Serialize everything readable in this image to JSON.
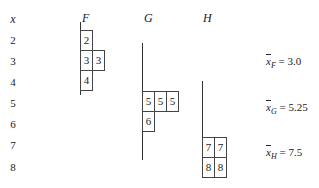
{
  "x_axis": {
    "header": "x",
    "values": [
      "2",
      "3",
      "4",
      "5",
      "6",
      "7",
      "8"
    ]
  },
  "groups": [
    {
      "name": "F",
      "cells": [
        {
          "row": "2",
          "values": [
            "2"
          ]
        },
        {
          "row": "3",
          "values": [
            "3",
            "3"
          ]
        },
        {
          "row": "4",
          "values": [
            "4"
          ]
        }
      ],
      "mean_symbol": "x",
      "mean_subscript": "F",
      "mean_text": "= 3.0"
    },
    {
      "name": "G",
      "cells": [
        {
          "row": "5",
          "values": [
            "5",
            "5",
            "5"
          ]
        },
        {
          "row": "6",
          "values": [
            "6"
          ]
        }
      ],
      "mean_symbol": "x",
      "mean_subscript": "G",
      "mean_text": "= 5.25"
    },
    {
      "name": "H",
      "cells": [
        {
          "row": "7",
          "values": [
            "7",
            "7"
          ]
        },
        {
          "row": "8",
          "values": [
            "8",
            "8"
          ]
        }
      ],
      "mean_symbol": "x",
      "mean_subscript": "H",
      "mean_text": "= 7.5"
    }
  ]
}
